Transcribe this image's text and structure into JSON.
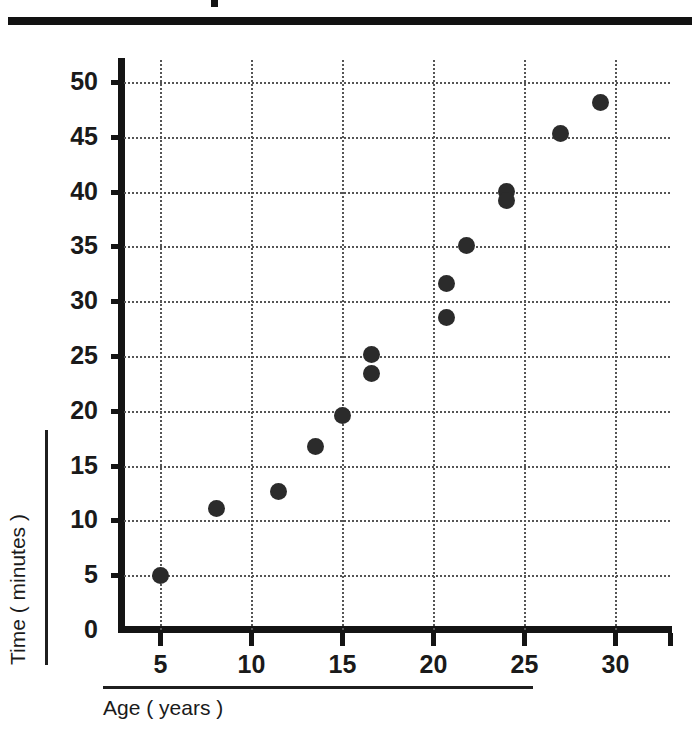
{
  "figure": {
    "title_fragment": "",
    "background_color": "#ffffff",
    "marker_color": "#2b2b2b",
    "axis_color": "#141414",
    "grid_color": "#555555"
  },
  "chart_data": {
    "type": "scatter",
    "title": "",
    "xlabel": "Age ( years )",
    "ylabel": "Time ( minutes )",
    "xlim": [
      3,
      33
    ],
    "ylim": [
      0,
      52
    ],
    "xticks": [
      5,
      10,
      15,
      20,
      25,
      30
    ],
    "yticks": [
      0,
      5,
      10,
      15,
      20,
      25,
      30,
      35,
      40,
      45,
      50
    ],
    "xtick_labels": [
      "5",
      "10",
      "15",
      "20",
      "25",
      "30"
    ],
    "ytick_labels": [
      "0",
      "5",
      "10",
      "15",
      "20",
      "25",
      "30",
      "35",
      "40",
      "45",
      "50"
    ],
    "grid": true,
    "grid_style": "dotted",
    "legend": "none",
    "points": [
      {
        "x": 5.0,
        "y": 5.0
      },
      {
        "x": 8.1,
        "y": 11.1
      },
      {
        "x": 11.5,
        "y": 12.6
      },
      {
        "x": 13.5,
        "y": 16.7
      },
      {
        "x": 15.0,
        "y": 19.6
      },
      {
        "x": 16.6,
        "y": 25.1
      },
      {
        "x": 16.6,
        "y": 23.4
      },
      {
        "x": 20.7,
        "y": 31.6
      },
      {
        "x": 20.7,
        "y": 28.5
      },
      {
        "x": 21.8,
        "y": 35.1
      },
      {
        "x": 24.0,
        "y": 40.0
      },
      {
        "x": 24.0,
        "y": 39.2
      },
      {
        "x": 27.0,
        "y": 45.3
      },
      {
        "x": 29.2,
        "y": 48.1
      }
    ]
  }
}
